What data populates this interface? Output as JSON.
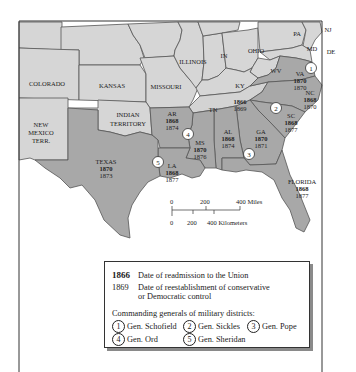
{
  "colors": {
    "union_state": "#d6d6d6",
    "former_confederate": "#a9a9a9",
    "tennessee": "#d0d0d0",
    "border": "#555555",
    "water": "#ffffff",
    "text": "#222222"
  },
  "states": {
    "colorado": {
      "name": "COLORADO"
    },
    "kansas": {
      "name": "KANSAS"
    },
    "missouri": {
      "name": "MISSOURI"
    },
    "illinois": {
      "name": "ILLINOIS"
    },
    "indiana": {
      "name": "IN"
    },
    "ohio": {
      "name": "OHIO"
    },
    "pennsylvania": {
      "name": "PA"
    },
    "new_jersey": {
      "name": "NJ"
    },
    "maryland": {
      "name": "MD"
    },
    "delaware": {
      "name": "DE"
    },
    "west_virginia": {
      "name": "WV"
    },
    "kentucky": {
      "name": "KY"
    },
    "indian_territory": {
      "name_line1": "INDIAN",
      "name_line2": "TERRITORY"
    },
    "new_mexico": {
      "name_line1": "NEW",
      "name_line2": "MEXICO",
      "name_line3": "TERR."
    },
    "virginia": {
      "name": "VA",
      "readmission": "1870",
      "control": "1870",
      "district": "1"
    },
    "north_carolina": {
      "name": "NC",
      "readmission": "1868",
      "control": "1870"
    },
    "south_carolina": {
      "name": "SC",
      "readmission": "1868",
      "control": "1877",
      "district": "2"
    },
    "georgia": {
      "name": "GA",
      "readmission": "1870",
      "control": "1871",
      "district": "3"
    },
    "florida": {
      "name": "FLORIDA",
      "readmission": "1868",
      "control": "1877"
    },
    "alabama": {
      "name": "AL",
      "readmission": "1868",
      "control": "1874"
    },
    "mississippi": {
      "name": "MS",
      "readmission": "1870",
      "control": "1876",
      "district": "4"
    },
    "louisiana": {
      "name": "LA",
      "readmission": "1868",
      "control": "1877",
      "district": "5"
    },
    "arkansas": {
      "name": "AR",
      "readmission": "1868",
      "control": "1874"
    },
    "texas": {
      "name": "TEXAS",
      "readmission": "1870",
      "control": "1873"
    },
    "tennessee": {
      "name": "TN",
      "readmission": "1866",
      "control": "1869"
    }
  },
  "scale": {
    "miles": {
      "ticks": [
        "0",
        "200",
        "400 Miles"
      ]
    },
    "kilometers": {
      "ticks": [
        "0",
        "200",
        "400 Kilometers"
      ]
    }
  },
  "legend": {
    "readmission_year": "1866",
    "readmission_label": "Date of readmission to the Union",
    "control_year": "1869",
    "control_label_line1": "Date of reestablishment of conservative",
    "control_label_line2": "or Democratic control",
    "generals_heading": "Commanding generals of military districts:",
    "generals": [
      {
        "num": "1",
        "name": "Gen. Schofield"
      },
      {
        "num": "2",
        "name": "Gen. Sickles"
      },
      {
        "num": "3",
        "name": "Gen. Pope"
      },
      {
        "num": "4",
        "name": "Gen. Ord"
      },
      {
        "num": "5",
        "name": "Gen. Sheridan"
      }
    ]
  }
}
